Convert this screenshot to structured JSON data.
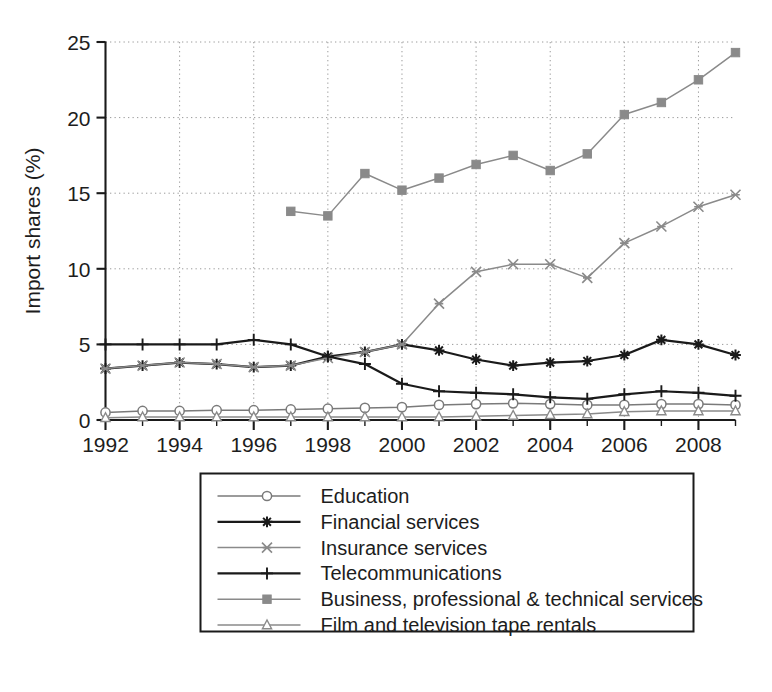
{
  "chart_data": {
    "type": "line",
    "title": "",
    "xlabel": "",
    "ylabel": "Import shares (%)",
    "xlim": [
      1992,
      2009
    ],
    "ylim": [
      0,
      25
    ],
    "yticks": [
      0,
      5,
      10,
      15,
      20,
      25
    ],
    "xticks": [
      1992,
      1994,
      1996,
      1998,
      2000,
      2002,
      2004,
      2006,
      2008
    ],
    "xtick_labels": [
      "1992",
      "1994",
      "1996",
      "1998",
      "2000",
      "2002",
      "2004",
      "2006",
      "2008"
    ],
    "ytick_labels": [
      "0",
      "5",
      "10",
      "15",
      "20",
      "25"
    ],
    "grid": true,
    "grid_style": "dotted",
    "legend_position": "below-plot",
    "x": [
      1992,
      1993,
      1994,
      1995,
      1996,
      1997,
      1998,
      1999,
      2000,
      2001,
      2002,
      2003,
      2004,
      2005,
      2006,
      2007,
      2008,
      2009
    ],
    "series": [
      {
        "name": "Education",
        "marker": "circle-open",
        "color": "#7a7a7a",
        "values": [
          0.5,
          0.6,
          0.6,
          0.65,
          0.65,
          0.7,
          0.75,
          0.8,
          0.85,
          1.0,
          1.05,
          1.1,
          1.05,
          1.0,
          1.0,
          1.05,
          1.05,
          1.0
        ]
      },
      {
        "name": "Financial services",
        "marker": "star",
        "color": "#1a1a1a",
        "values": [
          3.4,
          3.6,
          3.8,
          3.7,
          3.5,
          3.6,
          4.2,
          4.5,
          5.0,
          4.6,
          4.0,
          3.6,
          3.8,
          3.9,
          4.3,
          5.3,
          5.0,
          4.3
        ]
      },
      {
        "name": "Insurance services",
        "marker": "x-bar",
        "color": "#8a8a8a",
        "values": [
          3.4,
          3.6,
          3.8,
          3.7,
          3.5,
          3.6,
          4.1,
          4.5,
          5.0,
          7.7,
          9.8,
          10.3,
          10.3,
          9.4,
          11.7,
          12.8,
          14.1,
          14.9
        ]
      },
      {
        "name": "Telecommunications",
        "marker": "plus",
        "color": "#1a1a1a",
        "values": [
          5.0,
          5.0,
          5.0,
          5.0,
          5.3,
          5.0,
          4.2,
          3.7,
          2.4,
          1.9,
          1.8,
          1.7,
          1.5,
          1.4,
          1.7,
          1.9,
          1.8,
          1.6
        ]
      },
      {
        "name": "Business, professional & technical services",
        "marker": "square",
        "color": "#8a8a8a",
        "values": [
          null,
          null,
          null,
          null,
          null,
          13.8,
          13.5,
          16.3,
          15.2,
          16.0,
          16.9,
          17.5,
          16.5,
          17.6,
          20.2,
          21.0,
          22.5,
          24.3
        ]
      },
      {
        "name": "Film and television tape rentals",
        "marker": "triangle-open",
        "color": "#8a8a8a",
        "values": [
          0.15,
          0.2,
          0.2,
          0.2,
          0.2,
          0.2,
          0.2,
          0.2,
          0.2,
          0.2,
          0.25,
          0.3,
          0.35,
          0.4,
          0.55,
          0.6,
          0.6,
          0.6
        ]
      }
    ]
  },
  "legend": {
    "items": [
      {
        "label": "Education"
      },
      {
        "label": "Financial services"
      },
      {
        "label": "Insurance services"
      },
      {
        "label": "Telecommunications"
      },
      {
        "label": "Business, professional & technical services"
      },
      {
        "label": "Film and television tape rentals"
      }
    ]
  },
  "colors": {
    "background": "#ffffff",
    "axis": "#1a1a1a",
    "grid": "#9a9a9a",
    "dark_series": "#1a1a1a",
    "light_series": "#8a8a8a"
  }
}
